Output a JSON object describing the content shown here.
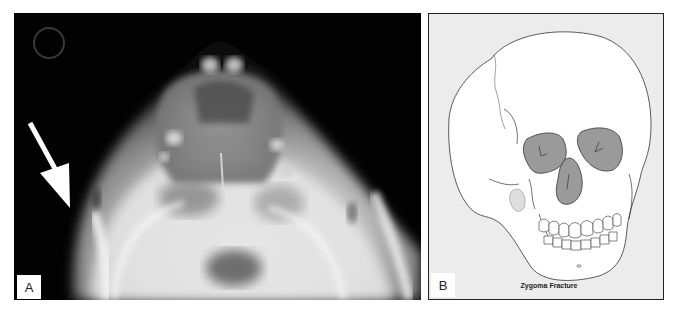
{
  "figure": {
    "panels": [
      {
        "id": "A",
        "label": "A",
        "kind": "radiograph",
        "description": "Submentovertex x-ray of skull with white arrow pointing at zygomatic arch",
        "arrow_color": "#ffffff"
      },
      {
        "id": "B",
        "label": "B",
        "kind": "illustration",
        "caption": "Zygoma Fracture",
        "highlight_color": "#9a9a9a",
        "background_color": "#ececec"
      }
    ]
  }
}
